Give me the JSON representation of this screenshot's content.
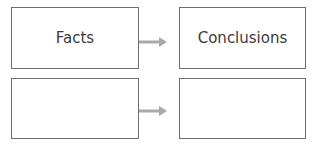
{
  "diagram": {
    "rows": [
      {
        "left": "Facts",
        "right": "Conclusions"
      },
      {
        "left": "",
        "right": ""
      }
    ],
    "arrow_color": "#a9a9a9",
    "border_color": "#6e6e6e"
  }
}
